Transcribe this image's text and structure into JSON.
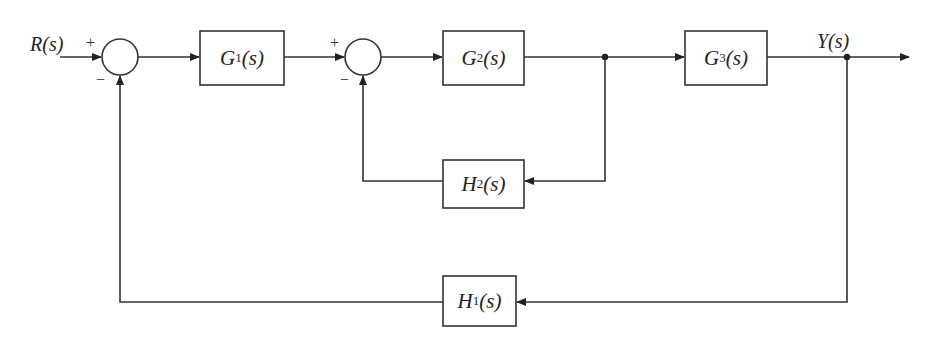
{
  "diagram": {
    "type": "block-diagram",
    "input": {
      "label": "R(s)"
    },
    "output": {
      "label": "Y(s)"
    },
    "summing_junctions": [
      {
        "id": "sum1",
        "plus_sign": "+",
        "minus_sign": "−"
      },
      {
        "id": "sum2",
        "plus_sign": "+",
        "minus_sign": "−"
      }
    ],
    "blocks": [
      {
        "id": "G1",
        "base": "G",
        "sub": "1",
        "tail": "(s)"
      },
      {
        "id": "G2",
        "base": "G",
        "sub": "2",
        "tail": "(s)"
      },
      {
        "id": "G3",
        "base": "G",
        "sub": "3",
        "tail": "(s)"
      },
      {
        "id": "H2",
        "base": "H",
        "sub": "2",
        "tail": "(s)"
      },
      {
        "id": "H1",
        "base": "H",
        "sub": "1",
        "tail": "(s)"
      }
    ],
    "connections": [
      {
        "from": "R(s)",
        "to": "sum1",
        "sign": "+"
      },
      {
        "from": "sum1",
        "to": "G1"
      },
      {
        "from": "G1",
        "to": "sum2",
        "sign": "+"
      },
      {
        "from": "sum2",
        "to": "G2"
      },
      {
        "from": "G2",
        "to": "G3"
      },
      {
        "from": "G2-output-branch",
        "to": "H2"
      },
      {
        "from": "H2",
        "to": "sum2",
        "sign": "−"
      },
      {
        "from": "G3",
        "to": "Y(s)"
      },
      {
        "from": "Y(s)-branch",
        "to": "H1"
      },
      {
        "from": "H1",
        "to": "sum1",
        "sign": "−"
      }
    ],
    "colors": {
      "line": "#333333",
      "background": "#ffffff"
    }
  }
}
